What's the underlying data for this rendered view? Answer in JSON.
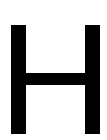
{
  "glyph": {
    "character": "H",
    "color": "#000000",
    "background": "#ffffff"
  }
}
